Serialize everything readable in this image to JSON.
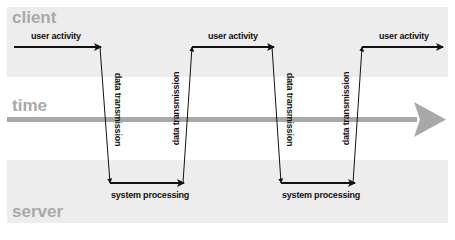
{
  "diagram": {
    "lanes": {
      "client": {
        "label": "client"
      },
      "time": {
        "label": "time"
      },
      "server": {
        "label": "server"
      }
    },
    "colors": {
      "band": "#ededed",
      "lane_label": "#a9a9a9",
      "time_arrow": "#a8a8a8",
      "line": "#111111"
    },
    "steps": [
      {
        "id": "user-activity-1",
        "label": "user activity",
        "lane": "client"
      },
      {
        "id": "data-transmission-1",
        "label": "data transmission",
        "direction": "client-to-server"
      },
      {
        "id": "system-processing-1",
        "label": "system processing",
        "lane": "server"
      },
      {
        "id": "data-transmission-2",
        "label": "data transmission",
        "direction": "server-to-client"
      },
      {
        "id": "user-activity-2",
        "label": "user activity",
        "lane": "client"
      },
      {
        "id": "data-transmission-3",
        "label": "data transmission",
        "direction": "client-to-server"
      },
      {
        "id": "system-processing-2",
        "label": "system processing",
        "lane": "server"
      },
      {
        "id": "data-transmission-4",
        "label": "data transmission",
        "direction": "server-to-client"
      },
      {
        "id": "user-activity-3",
        "label": "user activity",
        "lane": "client"
      }
    ]
  }
}
